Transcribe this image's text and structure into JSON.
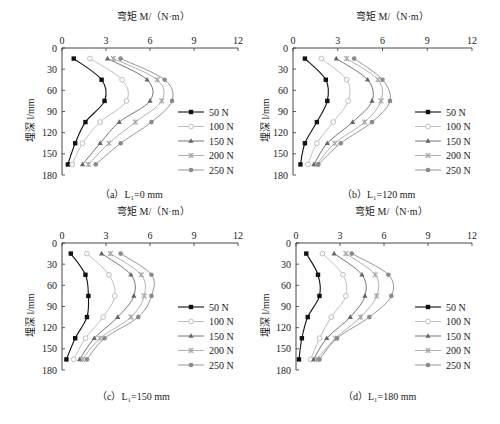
{
  "chart_data": [
    {
      "id": "a",
      "type": "line",
      "caption": "（a）L₁=0 mm",
      "title": "",
      "xlabel": "弯矩 M/（N·m）",
      "ylabel": "埋深 l/mm",
      "xlim": [
        0,
        12
      ],
      "ylim": [
        0,
        180
      ],
      "y_inverted": true,
      "x_axis_position": "top",
      "xticks": [
        0,
        3,
        6,
        9,
        12
      ],
      "yticks": [
        0,
        30,
        60,
        90,
        120,
        150,
        180
      ],
      "grid": false,
      "legend_position": "right",
      "depths": [
        15,
        45,
        75,
        105,
        135,
        165
      ],
      "series": [
        {
          "name": "50 N",
          "values": [
            0.8,
            2.7,
            2.9,
            1.6,
            0.9,
            0.4
          ]
        },
        {
          "name": "100 N",
          "values": [
            1.9,
            4.1,
            4.4,
            2.6,
            1.4,
            0.7
          ]
        },
        {
          "name": "150 N",
          "values": [
            3.1,
            5.8,
            6.0,
            3.9,
            2.6,
            1.4
          ]
        },
        {
          "name": "200 N",
          "values": [
            3.5,
            6.5,
            6.8,
            5.0,
            3.2,
            1.8
          ]
        },
        {
          "name": "250 N",
          "values": [
            4.0,
            7.0,
            7.5,
            6.1,
            4.0,
            2.3
          ]
        }
      ]
    },
    {
      "id": "b",
      "type": "line",
      "caption": "（b）L₁=120 mm",
      "title": "",
      "xlabel": "弯矩 M/（N·m）",
      "ylabel": "埋深 l/mm",
      "xlim": [
        0,
        12
      ],
      "ylim": [
        0,
        180
      ],
      "y_inverted": true,
      "x_axis_position": "top",
      "xticks": [
        0,
        3,
        6,
        9,
        12
      ],
      "yticks": [
        0,
        30,
        60,
        90,
        120,
        150,
        180
      ],
      "grid": false,
      "legend_position": "right",
      "depths": [
        15,
        45,
        75,
        105,
        135,
        165
      ],
      "series": [
        {
          "name": "50 N",
          "values": [
            0.8,
            2.2,
            2.3,
            1.6,
            0.8,
            0.5
          ]
        },
        {
          "name": "100 N",
          "values": [
            1.9,
            3.6,
            3.7,
            2.7,
            1.6,
            1.0
          ]
        },
        {
          "name": "150 N",
          "values": [
            2.9,
            5.0,
            5.3,
            4.0,
            2.3,
            1.4
          ]
        },
        {
          "name": "200 N",
          "values": [
            3.6,
            5.7,
            5.9,
            4.8,
            2.8,
            1.6
          ]
        },
        {
          "name": "250 N",
          "values": [
            4.1,
            6.0,
            6.5,
            5.3,
            3.2,
            1.7
          ]
        }
      ]
    },
    {
      "id": "c",
      "type": "line",
      "caption": "（c）L₁=150 mm",
      "title": "",
      "xlabel": "弯矩 M/（N·m）",
      "ylabel": "埋深 l/mm",
      "xlim": [
        0,
        12
      ],
      "ylim": [
        0,
        180
      ],
      "y_inverted": true,
      "x_axis_position": "top",
      "xticks": [
        0,
        3,
        6,
        9,
        12
      ],
      "yticks": [
        0,
        30,
        60,
        90,
        120,
        150,
        180
      ],
      "grid": false,
      "legend_position": "right",
      "depths": [
        15,
        45,
        75,
        105,
        135,
        165
      ],
      "series": [
        {
          "name": "50 N",
          "values": [
            0.6,
            1.6,
            1.8,
            1.7,
            0.9,
            0.3
          ]
        },
        {
          "name": "100 N",
          "values": [
            1.7,
            3.2,
            3.6,
            2.8,
            1.6,
            0.8
          ]
        },
        {
          "name": "150 N",
          "values": [
            2.7,
            4.7,
            4.9,
            3.8,
            2.2,
            1.2
          ]
        },
        {
          "name": "200 N",
          "values": [
            3.3,
            5.4,
            5.6,
            4.7,
            2.6,
            1.4
          ]
        },
        {
          "name": "250 N",
          "values": [
            4.0,
            6.1,
            6.1,
            5.2,
            2.9,
            1.7
          ]
        }
      ]
    },
    {
      "id": "d",
      "type": "line",
      "caption": "（d）L₁=180 mm",
      "title": "",
      "xlabel": "弯矩 M/（N·m）",
      "ylabel": "埋深 l/mm",
      "xlim": [
        0,
        12
      ],
      "ylim": [
        0,
        180
      ],
      "y_inverted": true,
      "x_axis_position": "top",
      "xticks": [
        0,
        3,
        6,
        9,
        12
      ],
      "yticks": [
        0,
        30,
        60,
        90,
        120,
        150,
        180
      ],
      "grid": false,
      "legend_position": "right",
      "depths": [
        15,
        45,
        75,
        105,
        135,
        165
      ],
      "series": [
        {
          "name": "50 N",
          "values": [
            0.7,
            1.5,
            1.6,
            0.8,
            0.4,
            0.2
          ]
        },
        {
          "name": "100 N",
          "values": [
            1.8,
            3.2,
            3.4,
            2.4,
            1.6,
            1.0
          ]
        },
        {
          "name": "150 N",
          "values": [
            2.6,
            4.5,
            4.7,
            3.7,
            2.1,
            1.2
          ]
        },
        {
          "name": "200 N",
          "values": [
            3.4,
            5.4,
            5.5,
            4.4,
            2.7,
            1.4
          ]
        },
        {
          "name": "250 N",
          "values": [
            3.8,
            6.3,
            6.5,
            5.0,
            2.8,
            1.6
          ]
        }
      ]
    }
  ],
  "series_style": [
    {
      "name": "50 N",
      "color": "#111111",
      "marker": "square-filled"
    },
    {
      "name": "100 N",
      "color": "#b8b8b8",
      "marker": "circle-hollow"
    },
    {
      "name": "150 N",
      "color": "#666666",
      "marker": "triangle"
    },
    {
      "name": "200 N",
      "color": "#a8a8a8",
      "marker": "cross"
    },
    {
      "name": "250 N",
      "color": "#8a8a8a",
      "marker": "diamond"
    }
  ],
  "legend_labels": [
    "50 N",
    "100 N",
    "150 N",
    "200 N",
    "250 N"
  ]
}
